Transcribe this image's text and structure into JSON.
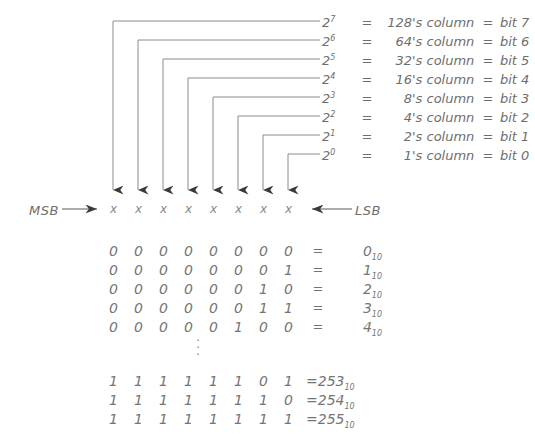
{
  "diagram": {
    "line_color": "#8c8c8c",
    "text_color": "#6e6e6e"
  },
  "legend": {
    "rows": [
      {
        "power_base": "2",
        "exponent": "7",
        "eq1": "=",
        "column_value": "128",
        "column_word": "'s column",
        "eq2": "=",
        "bit_label": "bit 7"
      },
      {
        "power_base": "2",
        "exponent": "6",
        "eq1": "=",
        "column_value": "64",
        "column_word": "'s column",
        "eq2": "=",
        "bit_label": "bit 6"
      },
      {
        "power_base": "2",
        "exponent": "5",
        "eq1": "=",
        "column_value": "32",
        "column_word": "'s column",
        "eq2": "=",
        "bit_label": "bit 5"
      },
      {
        "power_base": "2",
        "exponent": "4",
        "eq1": "=",
        "column_value": "16",
        "column_word": "'s column",
        "eq2": "=",
        "bit_label": "bit 4"
      },
      {
        "power_base": "2",
        "exponent": "3",
        "eq1": "=",
        "column_value": "8",
        "column_word": "'s column",
        "eq2": "=",
        "bit_label": "bit 3"
      },
      {
        "power_base": "2",
        "exponent": "2",
        "eq1": "=",
        "column_value": "4",
        "column_word": "'s column",
        "eq2": "=",
        "bit_label": "bit 2"
      },
      {
        "power_base": "2",
        "exponent": "1",
        "eq1": "=",
        "column_value": "2",
        "column_word": "'s column",
        "eq2": "=",
        "bit_label": "bit 1"
      },
      {
        "power_base": "2",
        "exponent": "0",
        "eq1": "=",
        "column_value": "1",
        "column_word": "'s column",
        "eq2": "=",
        "bit_label": "bit 0"
      }
    ]
  },
  "bit_row": {
    "msb_label": "MSB",
    "lsb_label": "LSB",
    "placeholders": [
      "x",
      "x",
      "x",
      "x",
      "x",
      "x",
      "x",
      "x"
    ]
  },
  "table": {
    "equals_symbol": "=",
    "subscript": "10",
    "ellipsis_dots": [
      "·",
      "·",
      "·"
    ],
    "upper_rows": [
      {
        "bits": [
          "0",
          "0",
          "0",
          "0",
          "0",
          "0",
          "0",
          "0"
        ],
        "equals": "=",
        "decimal": "0",
        "subscript": "10"
      },
      {
        "bits": [
          "0",
          "0",
          "0",
          "0",
          "0",
          "0",
          "0",
          "1"
        ],
        "equals": "=",
        "decimal": "1",
        "subscript": "10"
      },
      {
        "bits": [
          "0",
          "0",
          "0",
          "0",
          "0",
          "0",
          "1",
          "0"
        ],
        "equals": "=",
        "decimal": "2",
        "subscript": "10"
      },
      {
        "bits": [
          "0",
          "0",
          "0",
          "0",
          "0",
          "0",
          "1",
          "1"
        ],
        "equals": "=",
        "decimal": "3",
        "subscript": "10"
      },
      {
        "bits": [
          "0",
          "0",
          "0",
          "0",
          "0",
          "1",
          "0",
          "0"
        ],
        "equals": "=",
        "decimal": "4",
        "subscript": "10"
      }
    ],
    "lower_rows": [
      {
        "bits": [
          "1",
          "1",
          "1",
          "1",
          "1",
          "1",
          "0",
          "1"
        ],
        "equals": "=",
        "decimal": "253",
        "subscript": "10"
      },
      {
        "bits": [
          "1",
          "1",
          "1",
          "1",
          "1",
          "1",
          "1",
          "0"
        ],
        "equals": "=",
        "decimal": "254",
        "subscript": "10"
      },
      {
        "bits": [
          "1",
          "1",
          "1",
          "1",
          "1",
          "1",
          "1",
          "1"
        ],
        "equals": "=",
        "decimal": "255",
        "subscript": "10"
      }
    ]
  }
}
